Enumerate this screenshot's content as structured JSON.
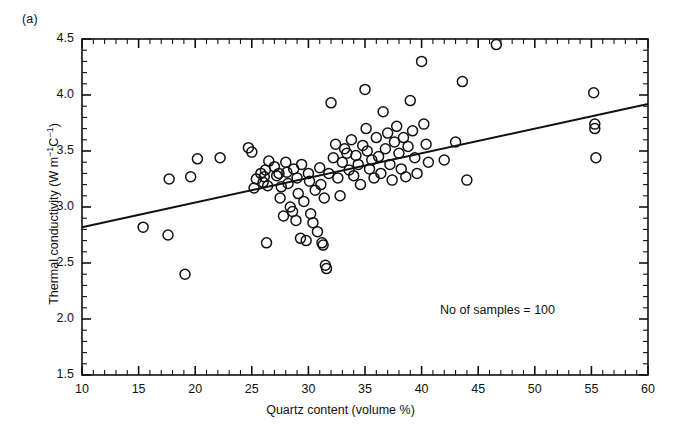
{
  "figure": {
    "panel_tag": "(a)",
    "annotation": "No of samples = 100",
    "background_color": "#ffffff",
    "ink_color": "#111111"
  },
  "chart_data": {
    "type": "scatter",
    "title": "",
    "panel_label": "(a)",
    "xlabel": "Quartz content (volume %)",
    "ylabel": "Thermal conductivity (W m⁻¹C⁻¹)",
    "ylabel_plain": "Thermal conductivity (W m-1C-1)",
    "xlim": [
      10,
      60
    ],
    "ylim": [
      1.5,
      4.5
    ],
    "x_major_ticks": [
      10,
      15,
      20,
      25,
      30,
      35,
      40,
      45,
      50,
      55,
      60
    ],
    "x_minor_tick_step": 1,
    "y_major_ticks": [
      1.5,
      2.0,
      2.5,
      3.0,
      3.5,
      4.0,
      4.5
    ],
    "y_minor_tick_step": 0.1,
    "x_tick_labels": [
      "10",
      "15",
      "20",
      "25",
      "30",
      "35",
      "40",
      "45",
      "50",
      "55",
      "60"
    ],
    "y_tick_labels": [
      "1.5",
      "2.0",
      "2.5",
      "3.0",
      "3.5",
      "4.0",
      "4.5"
    ],
    "grid": false,
    "legend": false,
    "legend_position": "none",
    "marker": "open-circle",
    "marker_radius_px": 5,
    "n_samples": 100,
    "annotation_text": "No of samples = 100",
    "trendline": {
      "type": "linear-fit",
      "x_start": 10,
      "y_start": 2.82,
      "x_end": 60,
      "y_end": 3.92,
      "slope_per_percent": 0.022,
      "intercept": 2.6
    },
    "points": [
      [
        15.4,
        2.82
      ],
      [
        17.6,
        2.75
      ],
      [
        19.1,
        2.4
      ],
      [
        17.7,
        3.25
      ],
      [
        19.6,
        3.27
      ],
      [
        20.2,
        3.43
      ],
      [
        22.2,
        3.44
      ],
      [
        24.7,
        3.53
      ],
      [
        25.0,
        3.49
      ],
      [
        25.2,
        3.17
      ],
      [
        25.4,
        3.25
      ],
      [
        25.8,
        3.3
      ],
      [
        26.0,
        3.22
      ],
      [
        26.1,
        3.27
      ],
      [
        26.2,
        3.33
      ],
      [
        26.4,
        3.19
      ],
      [
        26.3,
        2.68
      ],
      [
        26.5,
        3.41
      ],
      [
        27.0,
        3.36
      ],
      [
        27.2,
        3.28
      ],
      [
        27.4,
        3.3
      ],
      [
        27.5,
        3.08
      ],
      [
        27.6,
        3.18
      ],
      [
        27.8,
        2.92
      ],
      [
        28.0,
        3.4
      ],
      [
        28.1,
        3.31
      ],
      [
        28.2,
        3.21
      ],
      [
        28.4,
        3.0
      ],
      [
        28.6,
        2.96
      ],
      [
        28.7,
        3.34
      ],
      [
        28.9,
        2.88
      ],
      [
        29.0,
        3.26
      ],
      [
        29.1,
        3.12
      ],
      [
        29.3,
        2.72
      ],
      [
        29.4,
        3.38
      ],
      [
        29.6,
        3.05
      ],
      [
        29.8,
        2.7
      ],
      [
        30.0,
        3.3
      ],
      [
        30.1,
        3.23
      ],
      [
        30.2,
        2.94
      ],
      [
        30.4,
        2.86
      ],
      [
        30.6,
        3.15
      ],
      [
        30.8,
        2.78
      ],
      [
        31.0,
        3.35
      ],
      [
        31.1,
        3.2
      ],
      [
        31.2,
        2.68
      ],
      [
        31.3,
        2.66
      ],
      [
        31.4,
        3.08
      ],
      [
        31.5,
        2.48
      ],
      [
        31.6,
        2.45
      ],
      [
        31.8,
        3.3
      ],
      [
        32.0,
        3.93
      ],
      [
        32.2,
        3.44
      ],
      [
        32.4,
        3.56
      ],
      [
        32.6,
        3.26
      ],
      [
        32.8,
        3.1
      ],
      [
        33.0,
        3.4
      ],
      [
        33.2,
        3.52
      ],
      [
        33.4,
        3.48
      ],
      [
        33.6,
        3.33
      ],
      [
        33.8,
        3.6
      ],
      [
        34.0,
        3.28
      ],
      [
        34.2,
        3.46
      ],
      [
        34.4,
        3.38
      ],
      [
        34.6,
        3.2
      ],
      [
        34.8,
        3.55
      ],
      [
        35.0,
        4.05
      ],
      [
        35.1,
        3.7
      ],
      [
        35.2,
        3.5
      ],
      [
        35.4,
        3.34
      ],
      [
        35.6,
        3.42
      ],
      [
        35.8,
        3.26
      ],
      [
        36.0,
        3.62
      ],
      [
        36.2,
        3.45
      ],
      [
        36.4,
        3.3
      ],
      [
        36.6,
        3.85
      ],
      [
        36.8,
        3.52
      ],
      [
        37.0,
        3.66
      ],
      [
        37.2,
        3.38
      ],
      [
        37.4,
        3.24
      ],
      [
        37.6,
        3.58
      ],
      [
        37.8,
        3.72
      ],
      [
        38.0,
        3.48
      ],
      [
        38.2,
        3.34
      ],
      [
        38.4,
        3.62
      ],
      [
        38.6,
        3.27
      ],
      [
        38.8,
        3.54
      ],
      [
        39.0,
        3.95
      ],
      [
        39.2,
        3.68
      ],
      [
        39.4,
        3.44
      ],
      [
        39.6,
        3.3
      ],
      [
        40.0,
        4.3
      ],
      [
        40.2,
        3.74
      ],
      [
        40.4,
        3.56
      ],
      [
        40.6,
        3.4
      ],
      [
        42.0,
        3.42
      ],
      [
        43.0,
        3.58
      ],
      [
        43.6,
        4.12
      ],
      [
        44.0,
        3.24
      ],
      [
        46.6,
        4.45
      ],
      [
        55.2,
        4.02
      ],
      [
        55.3,
        3.74
      ],
      [
        55.3,
        3.7
      ],
      [
        55.4,
        3.44
      ]
    ]
  },
  "axes": {
    "plot_left_px": 82,
    "plot_right_px": 648,
    "plot_top_px": 39,
    "plot_bottom_px": 375
  }
}
